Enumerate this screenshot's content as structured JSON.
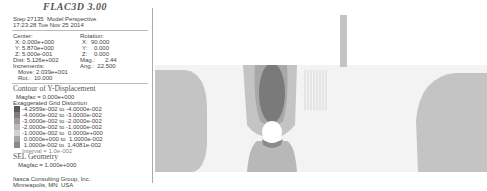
{
  "header": {
    "title": "FLAC3D 3.00",
    "step_line": "Step 27135  Model Perspective",
    "time_line": "17:23:28 Tue Nov 25 2014"
  },
  "view_params": {
    "center_label": "Center:",
    "center_x": "X: 0.000e+000",
    "center_y": "Y: 5.870e+000",
    "center_z": "Z: 5.000e-001",
    "dist": "Dist: 5.126e+002",
    "increments_label": "Increments:",
    "move": "Move: 2.039e+001",
    "rot": "Rot.:  10.000",
    "rotation_label": "Rotation:",
    "rot_x": "X:  90.000",
    "rot_y": "Y:    0.000",
    "rot_z": "Z:    0.000",
    "mag": "Mag.:      2.44",
    "ang": "Ang.:  22.500"
  },
  "contour": {
    "title": "Contour of Y-Displacement",
    "magfac": "Magfac = 0.000e+000",
    "distortion": "Exaggerated Grid Distortion",
    "ranges": [
      {
        "label": "-4.2959e-002 to -4.0000e-002",
        "color": "#5a5a5a"
      },
      {
        "label": "-4.0000e-002 to -3.0000e-002",
        "color": "#7d7d7d"
      },
      {
        "label": "-3.0000e-002 to -2.0000e-002",
        "color": "#9c9c9c"
      },
      {
        "label": "-2.0000e-002 to -1.0000e-002",
        "color": "#b9b9b9"
      },
      {
        "label": "-1.0000e-002 to  0.0000e+000",
        "color": "#d2d2d2"
      },
      {
        "label": " 0.0000e+000 to  1.0000e-002",
        "color": "#a6a6a6"
      },
      {
        "label": " 1.0000e-002 to  1.4081e-002",
        "color": "#8a8a8a"
      }
    ],
    "interval": "Interval = 1.0e-002"
  },
  "sel": {
    "title": "SEL Geometry",
    "magfac": "Magfac = 1.000e+000"
  },
  "footer": {
    "company": "Itasca Consulting Group, Inc.",
    "location": "Minneapolis, MN  USA"
  },
  "colors": {
    "background": "#ffffff",
    "band": "#f3f3f3",
    "light_zone": "#c4c4c4",
    "mid_zone": "#a8a8a8",
    "dark_zone": "#7a7a7a",
    "tunnel": "#ffffff"
  }
}
